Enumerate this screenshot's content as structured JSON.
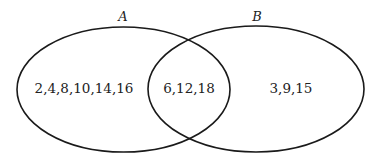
{
  "diagram": {
    "type": "venn",
    "stroke_color": "#1a1a1a",
    "sets": [
      {
        "name": "A",
        "label": "A",
        "only_elements": "2,4,8,10,14,16"
      },
      {
        "name": "B",
        "label": "B",
        "only_elements": "3,9,15"
      }
    ],
    "intersection": {
      "label": "6,12,18"
    }
  }
}
